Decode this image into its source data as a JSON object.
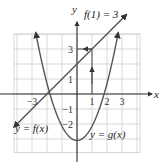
{
  "chart_data": {
    "type": "line",
    "title": "",
    "xlabel": "x",
    "ylabel": "y",
    "xlim": [
      -4.2,
      4.2
    ],
    "ylim": [
      -3.9,
      4.0
    ],
    "grid": true,
    "x_ticks": [
      {
        "value": -3,
        "label": "−3"
      },
      {
        "value": 1,
        "label": "1"
      },
      {
        "value": 2,
        "label": "2"
      },
      {
        "value": 3,
        "label": "3"
      }
    ],
    "y_ticks": [
      {
        "value": 3,
        "label": "3"
      },
      {
        "value": 1,
        "label": "1"
      },
      {
        "value": -1,
        "label": "−1"
      },
      {
        "value": -2,
        "label": "−2"
      }
    ],
    "series": [
      {
        "name": "f",
        "label": "y = f(x)",
        "kind": "line",
        "slope": 1,
        "intercept": 2,
        "x_range": [
          -4.2,
          3.3
        ],
        "points": [
          [
            -4.2,
            -2.2
          ],
          [
            -2,
            0
          ],
          [
            0,
            2
          ],
          [
            1,
            3
          ],
          [
            3.3,
            5.3
          ]
        ]
      },
      {
        "name": "g",
        "label": "y = g(x)",
        "kind": "parabola",
        "a": 0.95,
        "b": 0,
        "c": -3.1,
        "x_range": [
          -2.75,
          2.75
        ],
        "vertex": [
          0,
          -3.1
        ]
      }
    ],
    "annotations": [
      {
        "text": "f(1) = 3",
        "point": [
          1,
          3
        ],
        "description": "arrow up from x=1 to the line, then left to y=3"
      }
    ],
    "colors": {
      "curve": "#555555",
      "grid": "#cfcfcf",
      "axis": "#2a2a2a"
    }
  }
}
